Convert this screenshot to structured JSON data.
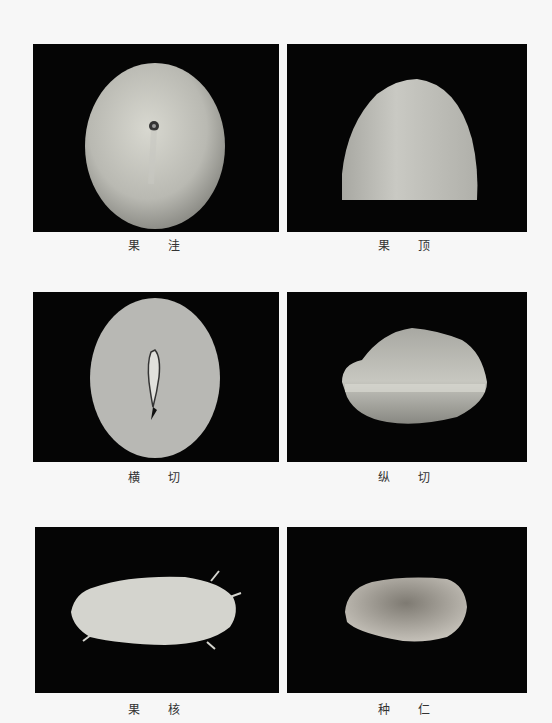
{
  "plate": {
    "figures": [
      {
        "id": "fruit-basin",
        "caption": "果 洼"
      },
      {
        "id": "fruit-apex",
        "caption": "果 顶"
      },
      {
        "id": "cross-section",
        "caption": "横 切"
      },
      {
        "id": "longitudinal-section",
        "caption": "纵 切"
      },
      {
        "id": "fruit-stone",
        "caption": "果 核"
      },
      {
        "id": "seed-kernel",
        "caption": "种 仁"
      }
    ]
  }
}
